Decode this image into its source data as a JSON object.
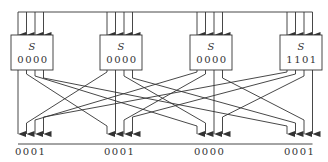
{
  "diagram": {
    "sboxes": [
      {
        "name": "S",
        "value": "0000"
      },
      {
        "name": "S",
        "value": "0000"
      },
      {
        "name": "S",
        "value": "0000"
      },
      {
        "name": "S",
        "value": "1101"
      }
    ],
    "outputs": [
      "0001",
      "0001",
      "0000",
      "0001"
    ],
    "colors": {
      "line": "#333333",
      "background": "#ffffff"
    }
  }
}
